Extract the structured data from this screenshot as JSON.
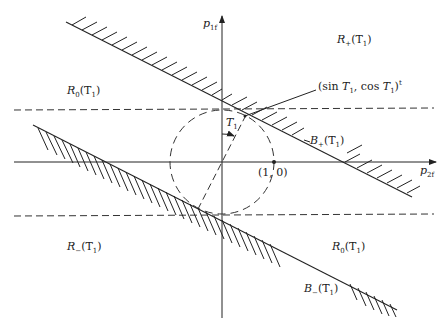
{
  "diagram": {
    "axes": {
      "y_label": "p",
      "y_label_sub": "1f",
      "x_label": "p",
      "x_label_sub": "2f"
    },
    "regions": {
      "r_plus": {
        "name": "R",
        "sub": "+",
        "arg": "(T",
        "arg_sub": "1",
        "close": ")"
      },
      "r0_left": {
        "name": "R",
        "sub": "0",
        "arg": "(T",
        "arg_sub": "1",
        "close": ")"
      },
      "r_minus": {
        "name": "R",
        "sub": "−",
        "arg": "(T",
        "arg_sub": "1",
        "close": ")"
      },
      "r0_right": {
        "name": "R",
        "sub": "0",
        "arg": "(T",
        "arg_sub": "1",
        "close": ")"
      }
    },
    "boundaries": {
      "b_plus": {
        "name": "B",
        "sub": "+",
        "arg": "(T",
        "arg_sub": "1",
        "close": ")"
      },
      "b_minus": {
        "name": "B",
        "sub": "−",
        "arg": "(T",
        "arg_sub": "1",
        "close": ")"
      }
    },
    "annotations": {
      "tangent_point": {
        "open": "(sin ",
        "t": "T",
        "t_sub": "1",
        "mid": ", cos ",
        "t2": "T",
        "t2_sub": "1",
        "close": ")",
        "sup": "t"
      },
      "unit_point": "(1, 0)",
      "angle": {
        "name": "T",
        "sub": "1"
      }
    },
    "geometry": {
      "origin": [
        222,
        162
      ],
      "radius": 52,
      "angle_deg": 26.6,
      "line_color": "#222222"
    }
  }
}
